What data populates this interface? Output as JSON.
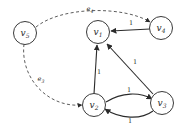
{
  "figure": {
    "kind": "directed-weighted-graph",
    "background_color": "#ffffff",
    "node_stroke_color": "#3a3a3a",
    "solid_edge_color": "#2b2b2b",
    "dashed_edge_color": "#4a4a4a"
  },
  "nodes": [
    {
      "id": "v1",
      "letter": "v",
      "subscript": "1",
      "cx": 98,
      "cy": 32
    },
    {
      "id": "v2",
      "letter": "v",
      "subscript": "2",
      "cx": 94,
      "cy": 105
    },
    {
      "id": "v3",
      "letter": "v",
      "subscript": "3",
      "cx": 162,
      "cy": 103
    },
    {
      "id": "v4",
      "letter": "v",
      "subscript": "4",
      "cx": 161,
      "cy": 28
    },
    {
      "id": "v5",
      "letter": "v",
      "subscript": "5",
      "cx": 25,
      "cy": 33
    }
  ],
  "edges": [
    {
      "id": "e-v4-v1",
      "from": "v4",
      "to": "v1",
      "style": "solid",
      "label": "1",
      "label_x": 131,
      "label_y": 23
    },
    {
      "id": "e-v2-v1",
      "from": "v2",
      "to": "v1",
      "style": "solid",
      "label": "1",
      "label_x": 99,
      "label_y": 72
    },
    {
      "id": "e-v3-v1",
      "from": "v3",
      "to": "v1",
      "style": "solid",
      "label": "1",
      "label_x": 135,
      "label_y": 62
    },
    {
      "id": "e-v2-v3-upper",
      "from": "v2",
      "to": "v3",
      "style": "solid",
      "label": "1",
      "label_x": 129,
      "label_y": 90
    },
    {
      "id": "e-v3-v2-lower",
      "from": "v3",
      "to": "v2",
      "style": "solid",
      "label": "1",
      "label_x": 130,
      "label_y": 121
    },
    {
      "id": "e-v5-v4",
      "from": "v5",
      "to": "v4",
      "style": "dashed",
      "label_letter": "e",
      "label_sub": "4",
      "label_x": 90,
      "label_y": 9
    },
    {
      "id": "e-v5-v2",
      "from": "v5",
      "to": "v2",
      "style": "dashed",
      "label_letter": "e",
      "label_sub": "3",
      "label_x": 41,
      "label_y": 79
    }
  ]
}
